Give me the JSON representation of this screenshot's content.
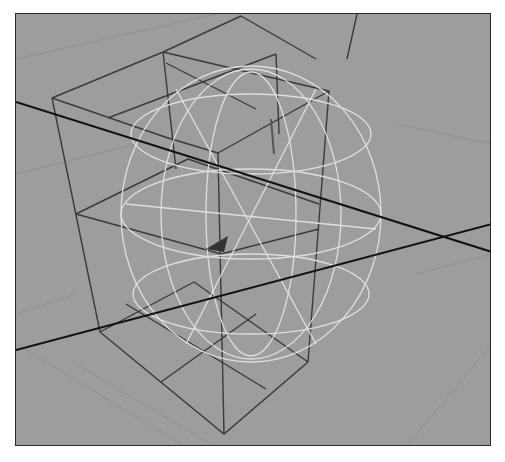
{
  "viewport": {
    "name": "3D perspective viewport",
    "background_color": "#9d9d9d",
    "objects": [
      {
        "name": "lattice-cube",
        "type": "lattice",
        "divisions": [
          2,
          2,
          2
        ],
        "color": "#3a3a3a"
      },
      {
        "name": "wireframe-sphere",
        "type": "polygon-sphere",
        "color": "#e6e6e6"
      },
      {
        "name": "world-axis",
        "type": "axis-line",
        "color": "#111111"
      }
    ]
  }
}
